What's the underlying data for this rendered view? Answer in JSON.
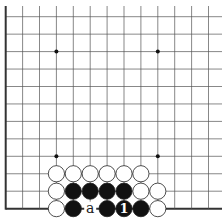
{
  "board": {
    "columns": 13,
    "rows": 12,
    "origin_x": 5.7,
    "origin_y": 16.7,
    "spacing_x": 16.9,
    "spacing_y": 17.45,
    "line_color": "#555555",
    "edge_color": "#333333",
    "edges": [
      "left",
      "bottom"
    ],
    "star_points": [
      [
        3,
        2
      ],
      [
        9,
        2
      ],
      [
        3,
        8
      ],
      [
        9,
        8
      ]
    ],
    "stones": [
      {
        "col": 3,
        "row": 9,
        "color": "white"
      },
      {
        "col": 4,
        "row": 9,
        "color": "white"
      },
      {
        "col": 5,
        "row": 9,
        "color": "white"
      },
      {
        "col": 6,
        "row": 9,
        "color": "white"
      },
      {
        "col": 7,
        "row": 9,
        "color": "white"
      },
      {
        "col": 8,
        "row": 9,
        "color": "white"
      },
      {
        "col": 3,
        "row": 10,
        "color": "white"
      },
      {
        "col": 4,
        "row": 10,
        "color": "black"
      },
      {
        "col": 5,
        "row": 10,
        "color": "black"
      },
      {
        "col": 6,
        "row": 10,
        "color": "black"
      },
      {
        "col": 7,
        "row": 10,
        "color": "black"
      },
      {
        "col": 8,
        "row": 10,
        "color": "white"
      },
      {
        "col": 9,
        "row": 10,
        "color": "white"
      },
      {
        "col": 3,
        "row": 11,
        "color": "white"
      },
      {
        "col": 4,
        "row": 11,
        "color": "black"
      },
      {
        "col": 6,
        "row": 11,
        "color": "black"
      },
      {
        "col": 7,
        "row": 11,
        "color": "black",
        "label": "1"
      },
      {
        "col": 8,
        "row": 11,
        "color": "black"
      },
      {
        "col": 9,
        "row": 11,
        "color": "white"
      }
    ],
    "labels": [
      {
        "col": 5,
        "row": 11,
        "text": "a"
      }
    ]
  }
}
